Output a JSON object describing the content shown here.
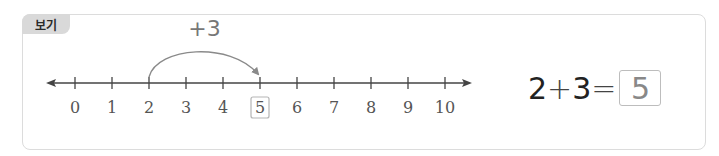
{
  "badge": {
    "label": "보기"
  },
  "number_line": {
    "min": 0,
    "max": 10,
    "ticks": [
      "0",
      "1",
      "2",
      "3",
      "4",
      "5",
      "6",
      "7",
      "8",
      "9",
      "10"
    ],
    "highlighted_value": 5,
    "jump": {
      "from": 2,
      "to": 5,
      "label": "+3"
    }
  },
  "equation": {
    "left": "2",
    "op": "+",
    "right": "3",
    "equals": "=",
    "answer": "5"
  },
  "colors": {
    "border": "#dcdcdc",
    "badge_bg": "#d9d9d9",
    "arc": "#8a8a8a",
    "axis": "#444444",
    "answer_box": "#bdbdbd"
  }
}
